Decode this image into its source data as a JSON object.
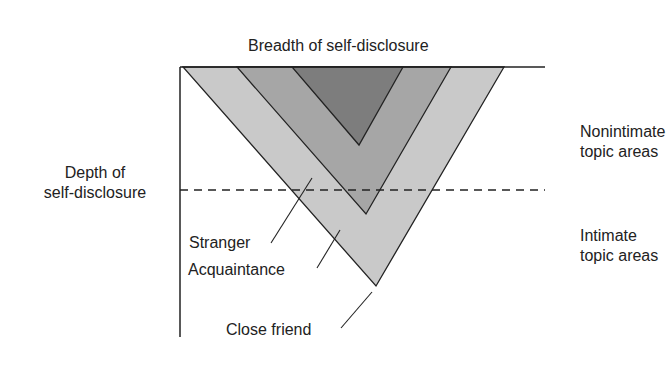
{
  "title": "Breadth of self-disclosure",
  "y_axis_label": [
    "Depth of",
    "self-disclosure"
  ],
  "regions": {
    "upper": [
      "Nonintimate",
      "topic areas"
    ],
    "lower": [
      "Intimate",
      "topic areas"
    ]
  },
  "relationships": [
    {
      "label": "Stranger",
      "color": "#7a7a7a"
    },
    {
      "label": "Acquaintance",
      "color": "#a3a3a3"
    },
    {
      "label": "Close friend",
      "color": "#c9c9c9"
    }
  ],
  "colors": {
    "line": "#222222"
  }
}
